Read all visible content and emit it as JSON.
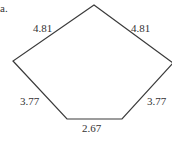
{
  "figure": {
    "part_label": "a.",
    "shape": "pentagon",
    "side_labels": {
      "top_left": "4.81",
      "top_right": "4.81",
      "bottom_left": "3.77",
      "bottom_right": "3.77",
      "bottom": "2.67"
    },
    "stroke_color": "#3a3a3a",
    "vertices": [
      [
        94,
        5
      ],
      [
        13,
        61
      ],
      [
        67,
        119
      ],
      [
        122,
        119
      ],
      [
        172,
        63
      ]
    ]
  }
}
